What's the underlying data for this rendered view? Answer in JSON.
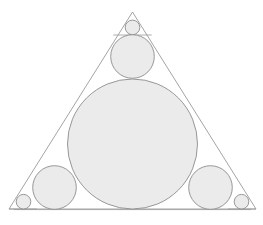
{
  "figure": {
    "background_color": "#ffffff",
    "fill_color": "#ebebeb",
    "stroke_color": "#8c8c8c",
    "outline_color": "#9a9a9a",
    "canvas": {
      "width": 263,
      "height": 225
    }
  },
  "chart_data": {
    "type": "diagram",
    "xlabel": "",
    "ylabel": "",
    "grid": false,
    "legend": false,
    "xlim": [
      0,
      263
    ],
    "ylim": [
      0,
      225
    ],
    "shapes": [
      {
        "name": "outer-triangle",
        "type": "polygon",
        "points": [
          [
            132.5,
            12.0
          ],
          [
            9.0,
            209.0
          ],
          [
            256.0,
            209.0
          ]
        ],
        "fill": "none",
        "stroke": "#9a9a9a"
      },
      {
        "name": "incircle",
        "type": "circle",
        "cx": 132.5,
        "cy": 144.0,
        "r": 65.0,
        "fill": "#ebebeb",
        "stroke": "#8c8c8c"
      },
      {
        "name": "top-medium-circle",
        "type": "circle",
        "cx": 132.5,
        "cy": 56.5,
        "r": 21.8,
        "fill": "#ebebeb",
        "stroke": "#8c8c8c"
      },
      {
        "name": "bottom-left-medium-circle",
        "type": "circle",
        "cx": 54.5,
        "cy": 187.5,
        "r": 21.8,
        "fill": "#ebebeb",
        "stroke": "#8c8c8c"
      },
      {
        "name": "bottom-right-medium-circle",
        "type": "circle",
        "cx": 210.5,
        "cy": 187.5,
        "r": 21.8,
        "fill": "#ebebeb",
        "stroke": "#8c8c8c"
      },
      {
        "name": "apex-small-circle",
        "type": "circle",
        "cx": 132.5,
        "cy": 27.4,
        "r": 7.3,
        "fill": "#ebebeb",
        "stroke": "#8c8c8c"
      },
      {
        "name": "bottom-left-small-circle",
        "type": "circle",
        "cx": 23.5,
        "cy": 201.7,
        "r": 7.3,
        "fill": "#ebebeb",
        "stroke": "#8c8c8c"
      },
      {
        "name": "bottom-right-small-circle",
        "type": "circle",
        "cx": 241.5,
        "cy": 201.7,
        "r": 7.3,
        "fill": "#ebebeb",
        "stroke": "#8c8c8c"
      },
      {
        "name": "apex-chord-line",
        "type": "line",
        "points": [
          [
            113.3,
            35.0
          ],
          [
            151.7,
            35.0
          ]
        ],
        "stroke": "#9a9a9a"
      },
      {
        "name": "bottom-left-chord-line",
        "type": "line",
        "points": [
          [
            9.0,
            209.0
          ],
          [
            35.0,
            209.0
          ]
        ],
        "stroke": "#9a9a9a"
      },
      {
        "name": "bottom-edge-inner-line",
        "type": "line",
        "points": [
          [
            14.0,
            209.6
          ],
          [
            251.0,
            209.6
          ]
        ],
        "stroke": "#9a9a9a"
      },
      {
        "name": "left-cevian",
        "type": "line",
        "points": [
          [
            132.5,
            12.0
          ],
          [
            9.0,
            209.0
          ]
        ],
        "stroke": "#9a9a9a"
      },
      {
        "name": "right-cevian",
        "type": "line",
        "points": [
          [
            132.5,
            12.0
          ],
          [
            256.0,
            209.0
          ]
        ],
        "stroke": "#9a9a9a"
      }
    ],
    "counts": {
      "triangles": 1,
      "large_circles": 1,
      "medium_circles": 3,
      "small_circles": 3,
      "total_circles": 7
    }
  }
}
